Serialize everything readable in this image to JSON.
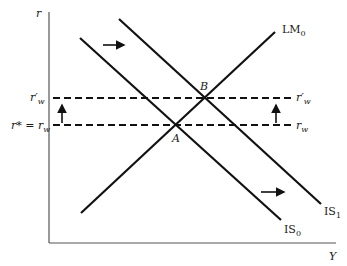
{
  "diagram": {
    "axes": {
      "y_label": "r",
      "x_label": "Y"
    },
    "curves": [
      {
        "id": "LM0",
        "label": "LM",
        "subscript": "0",
        "type": "upward-sloping"
      },
      {
        "id": "IS0",
        "label": "IS",
        "subscript": "0",
        "type": "downward-sloping"
      },
      {
        "id": "IS1",
        "label": "IS",
        "subscript": "1",
        "type": "downward-sloping"
      }
    ],
    "rate_lines": [
      {
        "id": "rw_prime",
        "left_label": "r′",
        "left_sub": "w",
        "right_label": "r′",
        "right_sub": "w"
      },
      {
        "id": "rw",
        "left_label": "r* = r",
        "left_sub": "w",
        "right_label": "r",
        "right_sub": "w"
      }
    ],
    "points": [
      {
        "id": "A",
        "label": "A"
      },
      {
        "id": "B",
        "label": "B"
      }
    ],
    "arrows": [
      {
        "id": "shift-right-top",
        "direction": "right"
      },
      {
        "id": "shift-right-bottom",
        "direction": "right"
      },
      {
        "id": "shift-up-left",
        "direction": "up"
      },
      {
        "id": "shift-up-right",
        "direction": "up"
      }
    ],
    "colors": {
      "line": "#111111",
      "axis": "#555555",
      "background": "#ffffff"
    }
  }
}
